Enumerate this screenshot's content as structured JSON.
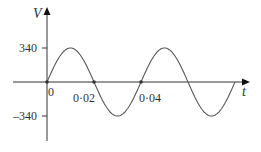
{
  "chart_data": {
    "type": "line",
    "title": "",
    "xlabel": "t",
    "ylabel": "V",
    "function": "V = 340 sin(2*pi*t/0.04)",
    "amplitude": 340,
    "period": 0.04,
    "x_ticks": [
      {
        "value": 0,
        "label": "0"
      },
      {
        "value": 0.02,
        "label": "0·02"
      },
      {
        "value": 0.04,
        "label": "0·04"
      }
    ],
    "y_ticks": [
      {
        "value": 340,
        "label": "340"
      },
      {
        "value": -340,
        "label": "–340"
      }
    ],
    "x": [
      0,
      0.01,
      0.02,
      0.03,
      0.04,
      0.05,
      0.06,
      0.07,
      0.08
    ],
    "series": [
      {
        "name": "V",
        "values": [
          0,
          340,
          0,
          -340,
          0,
          340,
          0,
          -340,
          0
        ]
      }
    ],
    "xlim": [
      0,
      0.08
    ],
    "ylim": [
      -340,
      340
    ],
    "grid": false,
    "legend": null
  },
  "colors": {
    "axis": "#333333",
    "curve": "#555555"
  }
}
